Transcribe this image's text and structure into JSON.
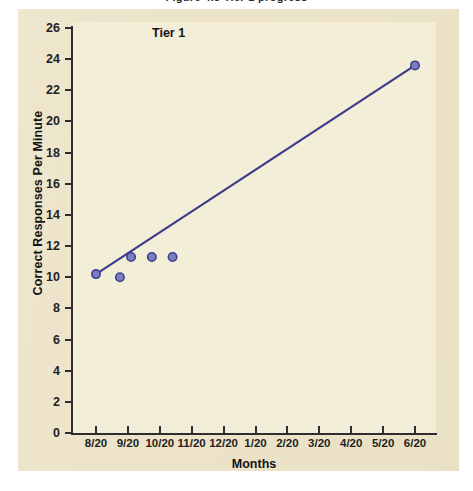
{
  "page": {
    "cropped_header_text": "Figure 4.3 Tier 1 progress",
    "background_color": "#ece3c8",
    "panel_color": "#f3eed7"
  },
  "chart_data": {
    "type": "scatter",
    "title": "Tier 1",
    "xlabel": "Months",
    "ylabel": "Correct Responses Per Minute",
    "xtick_labels": [
      "8/20",
      "9/20",
      "10/20",
      "11/20",
      "12/20",
      "1/20",
      "2/20",
      "3/20",
      "4/20",
      "5/20",
      "6/20"
    ],
    "ytick_labels": [
      "0",
      "2",
      "4",
      "6",
      "8",
      "10",
      "12",
      "14",
      "16",
      "18",
      "20",
      "22",
      "24",
      "26"
    ],
    "ylim": [
      0,
      26
    ],
    "xlim": [
      0,
      10
    ],
    "grid": false,
    "legend": "none",
    "marker_color": "#7b7fc0",
    "marker_edge_color": "#3f3f8f",
    "line_color": "#3c3c8c",
    "points": [
      {
        "x_label": "8/20",
        "x": 0.0,
        "y": 10.2
      },
      {
        "x_label": "9/20-",
        "x": 0.75,
        "y": 10.0
      },
      {
        "x_label": "9/20+",
        "x": 1.1,
        "y": 11.3
      },
      {
        "x_label": "10/20-",
        "x": 1.75,
        "y": 11.3
      },
      {
        "x_label": "10/20",
        "x": 2.4,
        "y": 11.3
      },
      {
        "x_label": "6/20",
        "x": 10.0,
        "y": 23.6
      }
    ],
    "trendline": {
      "name": "aim line",
      "x_start": 0.0,
      "y_start": 10.2,
      "x_end": 10.0,
      "y_end": 23.6
    }
  }
}
